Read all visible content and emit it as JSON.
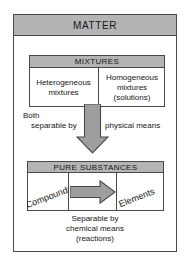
{
  "diagram": {
    "title": "MATTER",
    "root": {
      "label": "MATTER"
    },
    "mixtures": {
      "header": "MIXTURES",
      "cells": [
        {
          "line1": "Heterogeneous",
          "line2": "mixtures",
          "line3": ""
        },
        {
          "line1": "Homogeneous",
          "line2": "mixtures",
          "line3": "(solutions)"
        }
      ]
    },
    "middle": {
      "label_both": "Both",
      "label_separable_by": "separable by",
      "label_physical_means": "physical means",
      "arrow": "down-arrow"
    },
    "pure_substances": {
      "header": "PURE SUBSTANCES",
      "left_cell": "Compounds",
      "right_cell": "Elements",
      "arrow": "right-arrow"
    },
    "caption": {
      "line1": "Separable by",
      "line2": "chemical means",
      "line3": "(reactions)"
    }
  },
  "colors": {
    "header_fill": "#b4b4b4",
    "border": "#4a4a4a",
    "arrow_fill": "#9e9e9e",
    "arrow_stroke": "#4a4a4a",
    "background": "#ffffff",
    "text": "#151515"
  }
}
